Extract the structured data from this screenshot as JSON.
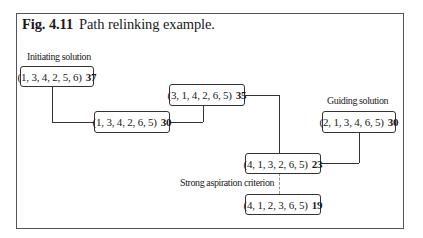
{
  "figure": {
    "label": "Fig. 4.11",
    "caption": "Path relinking example."
  },
  "labels": {
    "initiating": "Initiating solution",
    "guiding": "Guiding solution",
    "aspiration": "Strong aspiration criterion"
  },
  "nodes": [
    {
      "id": "initiating",
      "perm": "(1, 3, 4, 2, 5, 6)",
      "value": "37"
    },
    {
      "id": "step1",
      "perm": "(1, 3, 4, 2, 6, 5)",
      "value": "30"
    },
    {
      "id": "step2",
      "perm": "(3, 1, 4, 2, 6, 5)",
      "value": "35"
    },
    {
      "id": "guiding",
      "perm": "(2, 1, 3, 4, 6, 5)",
      "value": "30"
    },
    {
      "id": "step3",
      "perm": "(4, 1, 3, 2, 6, 5)",
      "value": "23"
    },
    {
      "id": "aspiration",
      "perm": "(4, 1, 2, 3, 6, 5)",
      "value": "19"
    }
  ],
  "edges": [
    {
      "from": "initiating",
      "to": "step1",
      "style": "solid"
    },
    {
      "from": "step1",
      "to": "step2",
      "style": "solid"
    },
    {
      "from": "step2",
      "to": "step3",
      "style": "solid"
    },
    {
      "from": "guiding",
      "to": "step3",
      "style": "solid"
    },
    {
      "from": "step3",
      "to": "aspiration",
      "style": "dashed"
    }
  ]
}
